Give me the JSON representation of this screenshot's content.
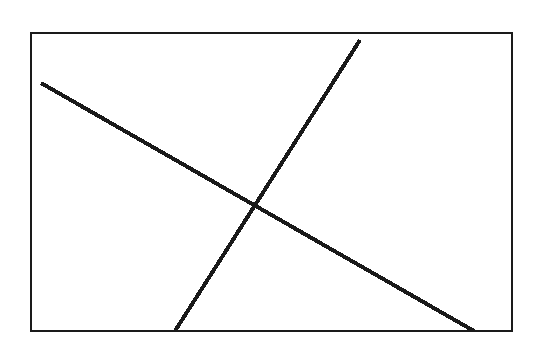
{
  "figure": {
    "title": "",
    "caption": "",
    "background_color": "#ffffff",
    "ink_color": "#1a1a1a",
    "canvas": {
      "width": 536,
      "height": 363
    },
    "frame": {
      "name": "rectangular-border",
      "x": 31,
      "y": 33,
      "width": 481,
      "height": 298,
      "stroke_width": 2,
      "stroke_color": "#1a1a1a",
      "fill": "none"
    },
    "lines": [
      {
        "name": "descending-line",
        "description": "straight line falling from upper-left to lower-right",
        "x1": 41,
        "y1": 83,
        "x2": 474,
        "y2": 331,
        "stroke_width": 4,
        "stroke_color": "#1a1a1a",
        "aliased": true
      },
      {
        "name": "ascending-line",
        "description": "straight line rising from lower-left to upper-right",
        "x1": 175,
        "y1": 331,
        "x2": 360,
        "y2": 40,
        "stroke_width": 4,
        "stroke_color": "#1a1a1a",
        "aliased": true
      }
    ],
    "intersection": {
      "name": "line-crossing-point",
      "x": 257,
      "y": 203,
      "marked": false
    },
    "labels": [],
    "axis_ticks": [],
    "legend": null
  },
  "chart_data": {
    "type": "line",
    "title": "",
    "xlabel": "",
    "ylabel": "",
    "grid": false,
    "legend_position": "none",
    "xlim": [
      31,
      512
    ],
    "ylim": [
      33,
      331
    ],
    "note": "Scanned bitmap line drawing: two straight lines crossing inside a plain rectangular frame. Coordinates are in screenshot pixel space with y increasing downward. No axis tick labels, no legend, and no annotations appear in the image.",
    "series": [
      {
        "name": "descending-line",
        "x": [
          41,
          474
        ],
        "y": [
          83,
          331
        ]
      },
      {
        "name": "ascending-line",
        "x": [
          175,
          360
        ],
        "y": [
          331,
          40
        ]
      }
    ],
    "annotations": [
      {
        "name": "intersection",
        "x": 257,
        "y": 203,
        "text": ""
      }
    ]
  }
}
